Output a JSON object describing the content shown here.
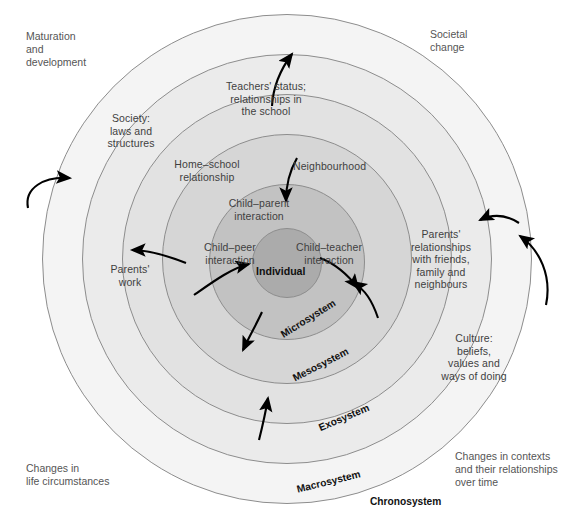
{
  "diagram": {
    "center_label": "Individual",
    "colors": {
      "chronosystem": "#f4f4f4",
      "macrosystem": "#ebebeb",
      "exosystem": "#e2e2e2",
      "mesosystem": "#d6d6d6",
      "microsystem": "#c2c2c2",
      "individual": "#ababab",
      "outline": "#8d8d8d",
      "text": "#3f3f3f",
      "arrow": "#000000"
    }
  },
  "system_labels": {
    "microsystem": "Microsystem",
    "mesosystem": "Mesosystem",
    "exosystem": "Exosystem",
    "macrosystem": "Macrosystem",
    "chronosystem": "Chronosystem"
  },
  "inner_labels": {
    "child_parent": "Child–parent\ninteraction",
    "child_peer": "Child–peer\ninteraction",
    "child_teacher": "Child–teacher\ninteraction"
  },
  "meso_labels": {
    "home_school": "Home–school\nrelationship",
    "neighbourhood": "Neighbourhood"
  },
  "exo_labels": {
    "teachers_status": "Teachers' status;\nrelationships in\nthe school",
    "parents_work": "Parents'\nwork",
    "parents_relationships": "Parents'\nrelationships\nwith friends,\nfamily and\nneighbours"
  },
  "macro_labels": {
    "society": "Society:\nlaws and\nstructures",
    "culture": "Culture:\nbeliefs,\nvalues and\nways of doing"
  },
  "chrono_labels": {
    "maturation": "Maturation\nand\ndevelopment",
    "societal_change": "Societal\nchange",
    "life_circumstances": "Changes in\nlife circumstances",
    "context_changes": "Changes in contexts\nand their relationships\nover time"
  }
}
